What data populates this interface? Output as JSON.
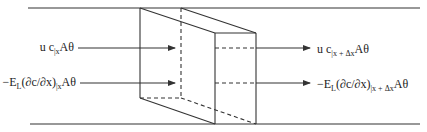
{
  "diagram": {
    "colors": {
      "stroke": "#333333",
      "background": "#ffffff"
    },
    "inflow": {
      "advection": {
        "prefix": "u c",
        "sub": "|x",
        "suffix": "Aθ"
      },
      "dispersion": {
        "prefix": "−E",
        "sub_L": "L",
        "mid": "(∂c/∂x)",
        "sub": "|x",
        "suffix": "Aθ"
      }
    },
    "outflow": {
      "advection": {
        "prefix": "u c",
        "sub": "|x + Δx",
        "suffix": "Aθ"
      },
      "dispersion": {
        "prefix": "−E",
        "sub_L": "L",
        "mid": "(∂c/∂x)",
        "sub": "|x + Δx",
        "suffix": "Aθ"
      }
    },
    "icons": {
      "arrow": "arrow-right-icon",
      "control_volume": "prism-control-volume"
    }
  }
}
